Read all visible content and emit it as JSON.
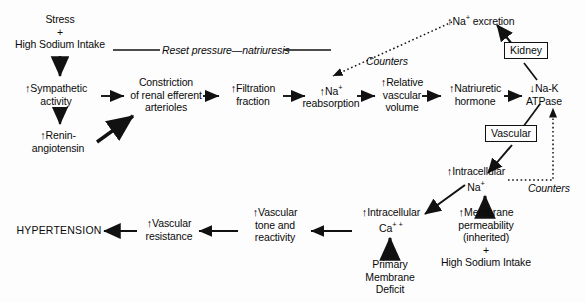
{
  "diagram": {
    "nodes": {
      "stress": {
        "l1": "Stress",
        "l2": "+",
        "l3": "High Sodium Intake"
      },
      "reset": {
        "label": "Reset pressure—natriuresis"
      },
      "sympathetic": {
        "arrow": "↑",
        "l1": "Sympathetic",
        "l2": "activity"
      },
      "renin": {
        "arrow": "↑",
        "l1": "Renin-",
        "l2": "angiotensin"
      },
      "constriction": {
        "l1": "Constriction",
        "l2": "of renal efferent",
        "l3": "arterioles"
      },
      "filtration": {
        "arrow": "↑",
        "l1": "Filtration",
        "l2": "fraction"
      },
      "na_reabsorption": {
        "arrow": "↑",
        "l1": "Na",
        "sup": "+",
        "l2": "reabsorption"
      },
      "relative_vascular": {
        "arrow": "↑",
        "l1": "Relative",
        "l2": "vascular",
        "l3": "volume"
      },
      "natriuretic": {
        "arrow": "↑",
        "l1": "Natriuretic",
        "l2": "hormone"
      },
      "na_k_atpase": {
        "arrow": "↓",
        "l1": "Na-K",
        "l2": "ATPase"
      },
      "na_excretion": {
        "arrow": "↑",
        "l1": "Na",
        "sup": "+",
        "l2": "excretion"
      },
      "kidney": {
        "label": "Kidney"
      },
      "vascular": {
        "label": "Vascular"
      },
      "counters_top": {
        "label": "Counters"
      },
      "counters_right": {
        "label": "Counters"
      },
      "intracellular_na": {
        "arrow": "↑",
        "l1": "Intracellular",
        "l2": "Na",
        "sup": "+"
      },
      "intracellular_ca": {
        "arrow": "↑",
        "l1": "Intracellular",
        "l2": "Ca",
        "sup": "+ +"
      },
      "membrane_perm": {
        "arrow": "↑",
        "l1": "Membrane",
        "l2": "permeability",
        "l3": "(inherited)",
        "l4": "+",
        "l5": "High Sodium Intake"
      },
      "primary_membrane": {
        "l1": "Primary",
        "l2": "Membrane",
        "l3": "Deficit"
      },
      "vascular_tone": {
        "arrow": "↑",
        "l1": "Vascular",
        "l2": "tone and",
        "l3": "reactivity"
      },
      "vascular_resistance": {
        "arrow": "↑",
        "l1": "Vascular",
        "l2": "resistance"
      },
      "hypertension": {
        "label": "HYPERTENSION"
      }
    },
    "colors": {
      "ink": "#0a0a0a",
      "background": "#fdfdfd"
    }
  }
}
